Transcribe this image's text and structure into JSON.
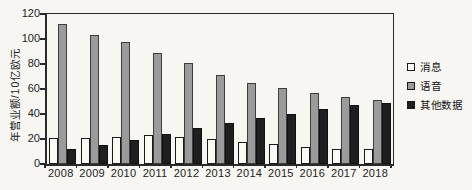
{
  "chart_data": {
    "type": "bar",
    "title": "",
    "xlabel": "",
    "ylabel": "年营业额/10亿欧元",
    "ylim": [
      0,
      120
    ],
    "yticks": [
      0,
      20,
      40,
      60,
      80,
      100,
      120
    ],
    "grid": false,
    "legend_position": "right",
    "categories": [
      "2008",
      "2009",
      "2010",
      "2011",
      "2012",
      "2013",
      "2014",
      "2015",
      "2016",
      "2017",
      "2018"
    ],
    "series": [
      {
        "name": "消息",
        "color": "#fbfaf6",
        "values": [
          21,
          21,
          22,
          23,
          22,
          20,
          18,
          16,
          14,
          12,
          12
        ]
      },
      {
        "name": "语音",
        "color": "#9b9b9b",
        "values": [
          112,
          103,
          98,
          89,
          81,
          71,
          65,
          61,
          57,
          54,
          51
        ]
      },
      {
        "name": "其他数据",
        "color": "#1f1f1f",
        "values": [
          12,
          15,
          19,
          24,
          29,
          33,
          37,
          40,
          44,
          47,
          49
        ]
      }
    ]
  },
  "colors": {
    "paper": "#f7f6f2",
    "axis": "#2a2a2a",
    "text": "#1c1c1c"
  }
}
